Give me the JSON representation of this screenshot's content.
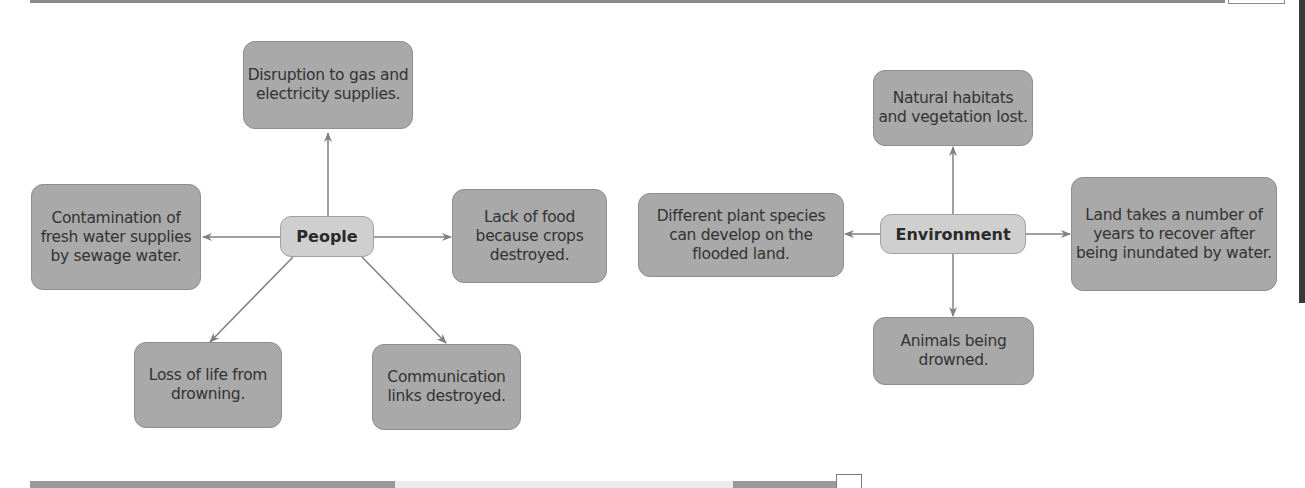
{
  "people_map": {
    "hub": "People",
    "nodes": [
      {
        "id": "top",
        "text": "Disruption to gas and electricity supplies."
      },
      {
        "id": "left",
        "text": "Contamination of fresh water supplies by sewage water."
      },
      {
        "id": "right",
        "text": "Lack of food because crops destroyed."
      },
      {
        "id": "bottom-left",
        "text": "Loss of life from drowning."
      },
      {
        "id": "bottom-right",
        "text": "Communication links destroyed."
      }
    ]
  },
  "environment_map": {
    "hub": "Environment",
    "nodes": [
      {
        "id": "top",
        "text": "Natural habitats and vegetation lost."
      },
      {
        "id": "left",
        "text": "Different plant species can develop on the flooded land."
      },
      {
        "id": "right",
        "text": "Land takes a number of years to recover after being inundated by water."
      },
      {
        "id": "bottom",
        "text": "Animals being drowned."
      }
    ]
  },
  "colors": {
    "node_fill": "#a9a9a9",
    "hub_fill": "#cfcfcf",
    "arrow": "#808080"
  }
}
